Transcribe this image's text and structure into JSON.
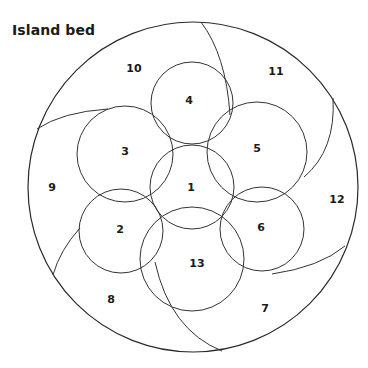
{
  "title": "Island bed",
  "colors": {
    "stroke": "#333333",
    "text": "#1a1a1a",
    "background": "#ffffff"
  },
  "outer_bed": {
    "cx": 193,
    "cy": 187,
    "r": 165
  },
  "circles": [
    {
      "id": "1",
      "label": "1",
      "cx": 192,
      "cy": 187,
      "r": 42
    },
    {
      "id": "2",
      "label": "2",
      "cx": 121,
      "cy": 231,
      "r": 42
    },
    {
      "id": "3",
      "label": "3",
      "cx": 125,
      "cy": 154,
      "r": 48
    },
    {
      "id": "4",
      "label": "4",
      "cx": 192,
      "cy": 103,
      "r": 41
    },
    {
      "id": "5",
      "label": "5",
      "cx": 257,
      "cy": 152,
      "r": 50
    },
    {
      "id": "6",
      "label": "6",
      "cx": 262,
      "cy": 229,
      "r": 42
    },
    {
      "id": "13",
      "label": "13",
      "cx": 192,
      "cy": 259,
      "r": 52
    }
  ],
  "labels": [
    {
      "text": "1",
      "x": 191,
      "y": 188
    },
    {
      "text": "2",
      "x": 120,
      "y": 230
    },
    {
      "text": "3",
      "x": 125,
      "y": 152
    },
    {
      "text": "4",
      "x": 189,
      "y": 101
    },
    {
      "text": "5",
      "x": 257,
      "y": 149
    },
    {
      "text": "6",
      "x": 261,
      "y": 228
    },
    {
      "text": "7",
      "x": 265,
      "y": 309
    },
    {
      "text": "8",
      "x": 111,
      "y": 300
    },
    {
      "text": "9",
      "x": 52,
      "y": 188
    },
    {
      "text": "10",
      "x": 134,
      "y": 69
    },
    {
      "text": "11",
      "x": 276,
      "y": 72
    },
    {
      "text": "12",
      "x": 337,
      "y": 200
    },
    {
      "text": "13",
      "x": 197,
      "y": 264
    }
  ],
  "swirl_arcs": [
    {
      "name": "arc-9-10",
      "d": "M 37 129 Q 62 112 108 109"
    },
    {
      "name": "arc-10-11",
      "d": "M 201 22 Q 226 55 230 115"
    },
    {
      "name": "arc-11-12",
      "d": "M 333 98 Q 336 150 304 177"
    },
    {
      "name": "arc-12-7",
      "d": "M 345 246 Q 320 267 272 274"
    },
    {
      "name": "arc-7-8",
      "d": "M 222 351 Q 170 330 155 262"
    },
    {
      "name": "arc-8-9",
      "d": "M 53 275 Q 60 250 80 228"
    }
  ]
}
